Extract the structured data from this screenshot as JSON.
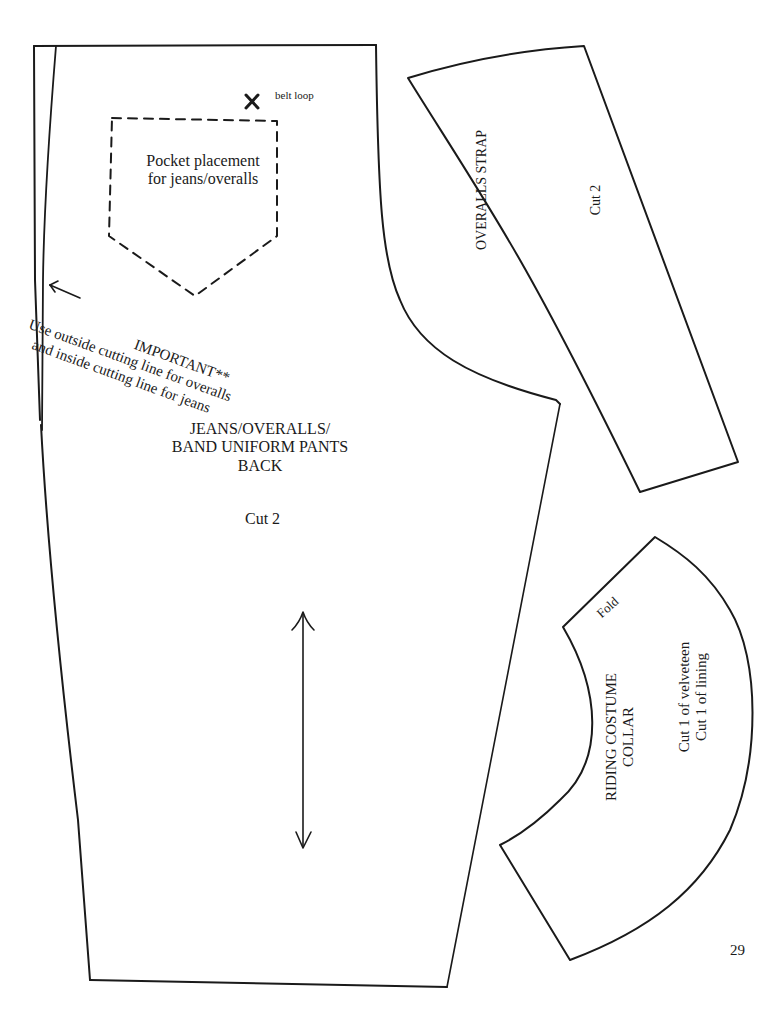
{
  "page": {
    "number": "29",
    "background": "#ffffff",
    "ink_color": "#1a1a1a"
  },
  "pants_back": {
    "belt_loop_label": "belt loop",
    "belt_loop_marker": "x-mark",
    "pocket_label": [
      "Pocket placement",
      "for jeans/overalls"
    ],
    "important_note": [
      "IMPORTANT**",
      "Use outside cutting line for overalls",
      "and inside cutting line for jeans"
    ],
    "title": [
      "JEANS/OVERALLS/",
      "BAND UNIFORM PANTS",
      "BACK"
    ],
    "cut": "Cut 2",
    "grainline": "double-arrow-grainline"
  },
  "overalls_strap": {
    "title": "OVERALLS STRAP",
    "cut": "Cut 2"
  },
  "riding_collar": {
    "fold_label": "Fold",
    "title": [
      "RIDING COSTUME",
      "COLLAR"
    ],
    "cut": [
      "Cut 1 of velveteen",
      "Cut 1 of lining"
    ]
  }
}
